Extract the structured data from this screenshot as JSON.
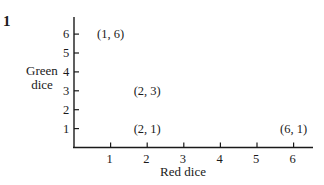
{
  "figure_label": "1",
  "chart_data": {
    "type": "scatter",
    "title": "",
    "xlabel": "Red dice",
    "ylabel": "Green dice",
    "ylabel_lines": [
      "Green",
      "dice"
    ],
    "x_ticks": [
      "1",
      "2",
      "3",
      "4",
      "5",
      "6"
    ],
    "y_ticks": [
      "1",
      "2",
      "3",
      "4",
      "5",
      "6"
    ],
    "xlim": [
      0,
      6.5
    ],
    "ylim": [
      0,
      6.6
    ],
    "grid": false,
    "legend": null,
    "points": [
      {
        "x": 1,
        "y": 6,
        "label": "(1, 6)"
      },
      {
        "x": 2,
        "y": 3,
        "label": "(2, 3)"
      },
      {
        "x": 2,
        "y": 1,
        "label": "(2, 1)"
      },
      {
        "x": 6,
        "y": 1,
        "label": "(6, 1)"
      }
    ],
    "marker": "label-only"
  }
}
